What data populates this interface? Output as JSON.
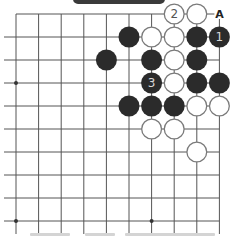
{
  "diagram": {
    "type": "go-board-problem",
    "board": {
      "columns": 10,
      "rows": 10,
      "origin_x": 16,
      "origin_y": 14,
      "spacing_x": 22.6,
      "spacing_y": 23,
      "line_color": "#555555",
      "stone_radius": 10.5
    },
    "colors": {
      "black_stone": "#2b2b2b",
      "white_stone_fill": "#ffffff",
      "white_stone_stroke": "#7a7a7a",
      "label_on_black": "#d8d8d8",
      "label_on_white": "#555555",
      "banner": "#3a3a3a"
    },
    "star_points": [
      {
        "col": 0,
        "row": 3
      },
      {
        "col": 0,
        "row": 9
      },
      {
        "col": 6,
        "row": 9
      }
    ],
    "stones": [
      {
        "col": 7,
        "row": 0,
        "color": "white",
        "label": "2"
      },
      {
        "col": 8,
        "row": 0,
        "color": "white",
        "label": ""
      },
      {
        "col": 5,
        "row": 1,
        "color": "black",
        "label": ""
      },
      {
        "col": 6,
        "row": 1,
        "color": "white",
        "label": ""
      },
      {
        "col": 7,
        "row": 1,
        "color": "white",
        "label": ""
      },
      {
        "col": 8,
        "row": 1,
        "color": "black",
        "label": ""
      },
      {
        "col": 9,
        "row": 1,
        "color": "black",
        "label": "1"
      },
      {
        "col": 4,
        "row": 2,
        "color": "black",
        "label": ""
      },
      {
        "col": 6,
        "row": 2,
        "color": "black",
        "label": ""
      },
      {
        "col": 7,
        "row": 2,
        "color": "white",
        "label": ""
      },
      {
        "col": 8,
        "row": 2,
        "color": "black",
        "label": ""
      },
      {
        "col": 6,
        "row": 3,
        "color": "black",
        "label": "3"
      },
      {
        "col": 7,
        "row": 3,
        "color": "white",
        "label": ""
      },
      {
        "col": 8,
        "row": 3,
        "color": "black",
        "label": ""
      },
      {
        "col": 9,
        "row": 3,
        "color": "black",
        "label": ""
      },
      {
        "col": 5,
        "row": 4,
        "color": "black",
        "label": ""
      },
      {
        "col": 6,
        "row": 4,
        "color": "black",
        "label": ""
      },
      {
        "col": 7,
        "row": 4,
        "color": "black",
        "label": ""
      },
      {
        "col": 8,
        "row": 4,
        "color": "white",
        "label": ""
      },
      {
        "col": 9,
        "row": 4,
        "color": "white",
        "label": ""
      },
      {
        "col": 6,
        "row": 5,
        "color": "white",
        "label": ""
      },
      {
        "col": 7,
        "row": 5,
        "color": "white",
        "label": ""
      },
      {
        "col": 8,
        "row": 6,
        "color": "white",
        "label": ""
      }
    ],
    "point_labels": [
      {
        "col": 9,
        "row": 0,
        "text": "A"
      }
    ]
  }
}
